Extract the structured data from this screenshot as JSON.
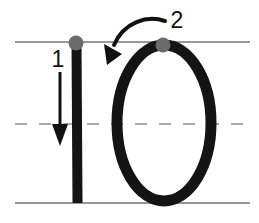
{
  "figure": {
    "background_color": "#ffffff",
    "width": 259,
    "height": 223,
    "guidelines": {
      "solid_color": "#999999",
      "dashed_color": "#a8a8a8",
      "top_line_y": 42,
      "mid_line_y": 124,
      "bottom_line_y": 203,
      "x_start": 15,
      "x_end": 250,
      "dash_pattern": "12 12"
    },
    "stroke_color": "#111111",
    "start_dot_color": "#6b6b6b",
    "start_dots": [
      {
        "name": "stroke-1-start-dot",
        "cx": 76,
        "cy": 43,
        "r": 7
      },
      {
        "name": "stroke-2-start-dot",
        "cx": 163,
        "cy": 46,
        "r": 7
      }
    ],
    "strokes": [
      {
        "id": 1,
        "label": "1",
        "name": "vertical-stroke",
        "description": "vertical downstroke forming the digit one",
        "label_x": 58,
        "label_y": 66,
        "direction": "down",
        "arrow": {
          "x": 60,
          "y_start": 72,
          "y_end": 132,
          "tip_y": 145
        }
      },
      {
        "id": 2,
        "label": "2",
        "name": "oval-stroke",
        "description": "counter-clockwise oval forming the digit zero",
        "label_x": 170,
        "label_y": 28,
        "direction": "counter-clockwise",
        "arrow": {
          "path": "M 164,22 C 148,17 126,23 114,44",
          "tip_x": 110,
          "tip_y": 62
        }
      }
    ]
  }
}
